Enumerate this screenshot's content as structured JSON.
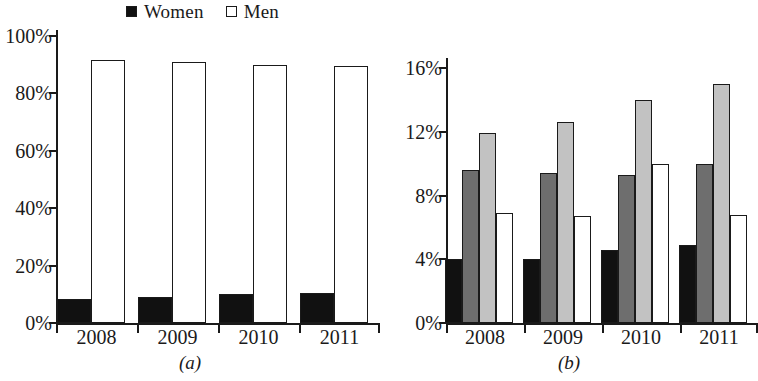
{
  "figure": {
    "panels": [
      {
        "id": "a",
        "caption": "(a)",
        "legend": [
          {
            "label": "Women",
            "color": "#111111"
          },
          {
            "label": "Men",
            "color": "#ffffff"
          }
        ]
      },
      {
        "id": "b",
        "caption": "(b)",
        "legend": [
          {
            "label": "Executive",
            "color": "#111111"
          },
          {
            "label": "Proprietary",
            "color": "#6e6e6e"
          },
          {
            "label": "Independents",
            "color": "#c2c2c2"
          },
          {
            "label": "Others",
            "color": "#ffffff"
          }
        ]
      }
    ]
  },
  "chart_data": [
    {
      "type": "bar",
      "panel": "(a)",
      "title": "",
      "xlabel": "",
      "ylabel": "",
      "categories": [
        "2008",
        "2009",
        "2010",
        "2011"
      ],
      "yticklabels": [
        "0%",
        "20%",
        "40%",
        "60%",
        "80%",
        "100%"
      ],
      "ytickvalues": [
        0,
        20,
        40,
        60,
        80,
        100
      ],
      "ylim": [
        0,
        100
      ],
      "grid": false,
      "legend_position": "top-center",
      "series": [
        {
          "name": "Women",
          "color": "#111111",
          "values": [
            8.3,
            9.0,
            10.0,
            10.3
          ]
        },
        {
          "name": "Men",
          "color": "#ffffff",
          "values": [
            91.7,
            91.0,
            90.0,
            89.7
          ]
        }
      ]
    },
    {
      "type": "bar",
      "panel": "(b)",
      "title": "",
      "xlabel": "",
      "ylabel": "",
      "categories": [
        "2008",
        "2009",
        "2010",
        "2011"
      ],
      "yticklabels": [
        "0%",
        "4%",
        "8%",
        "12%",
        "16%"
      ],
      "ytickvalues": [
        0,
        4,
        8,
        12,
        16
      ],
      "ylim": [
        0,
        16
      ],
      "grid": false,
      "legend_position": "top-center",
      "series": [
        {
          "name": "Executive",
          "color": "#111111",
          "values": [
            4.0,
            4.0,
            4.6,
            4.9
          ]
        },
        {
          "name": "Proprietary",
          "color": "#6e6e6e",
          "values": [
            9.6,
            9.4,
            9.3,
            10.0
          ]
        },
        {
          "name": "Independents",
          "color": "#c2c2c2",
          "values": [
            11.9,
            12.6,
            14.0,
            15.0
          ]
        },
        {
          "name": "Others",
          "color": "#ffffff",
          "values": [
            6.9,
            6.7,
            10.0,
            6.8
          ]
        }
      ]
    }
  ]
}
